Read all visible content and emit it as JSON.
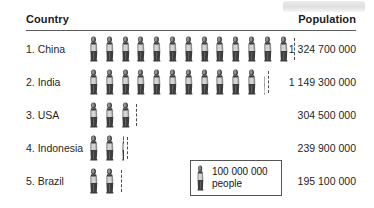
{
  "header": {
    "country_label": "Country",
    "population_label": "Population"
  },
  "legend": {
    "amount": "100 000 000",
    "unit": "people",
    "icon": "person-pictogram-icon"
  },
  "rows": [
    {
      "rank_label": "1. China",
      "population": "1 324 700 000",
      "full_icons": 13,
      "partial_fraction": 0.0
    },
    {
      "rank_label": "2. India",
      "population": "1 149 300 000",
      "full_icons": 11,
      "partial_fraction": 0.35
    },
    {
      "rank_label": "3. USA",
      "population": "304 500 000",
      "full_icons": 3,
      "partial_fraction": 0.0
    },
    {
      "rank_label": "4. Indonesia",
      "population": "239 900 000",
      "full_icons": 2,
      "partial_fraction": 0.38
    },
    {
      "rank_label": "5. Brazil",
      "population": "195 100 000",
      "full_icons": 2,
      "partial_fraction": 0.0
    }
  ],
  "chart_data": {
    "type": "bar",
    "subtype": "pictogram",
    "title": "",
    "xlabel": "",
    "ylabel": "",
    "categories": [
      "1. China",
      "2. India",
      "3. USA",
      "4. Indonesia",
      "5. Brazil"
    ],
    "values": [
      1324700000,
      1149300000,
      304500000,
      239900000,
      195100000
    ],
    "value_labels": [
      "1 324 700 000",
      "1 149 300 000",
      "304 500 000",
      "239 900 000",
      "195 100 000"
    ],
    "icons_per_category": [
      13.25,
      11.35,
      3.0,
      2.4,
      2.0
    ],
    "icon_unit_value": 100000000,
    "icon_unit_label": "100 000 000 people",
    "column_headers": [
      "Country",
      "Population"
    ],
    "grid": false,
    "legend_position": "bottom-center"
  },
  "colors": {
    "text": "#1a1a1a",
    "rule": "#5a5a5a",
    "figure_dark": "#3c3c3c",
    "figure_mid": "#8f8f8f",
    "figure_light": "#d4d4d4",
    "legend_border": "#555555",
    "chip": "#e2e2e2"
  }
}
